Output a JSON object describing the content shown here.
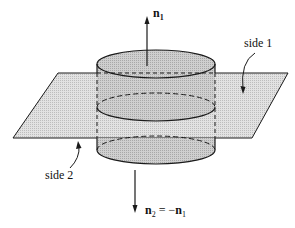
{
  "figure": {
    "labels": {
      "n1": "n",
      "n1_sub": "1",
      "side1": "side 1",
      "side2": "side 2",
      "n2": "n",
      "n2_sub": "2",
      "eq": " = −",
      "n1b": "n",
      "n1b_sub": "1"
    },
    "colors": {
      "plane_fill": "#d8d8d8",
      "cyl_fill": "#c4c4c4",
      "stroke": "#1a1a1a"
    }
  }
}
